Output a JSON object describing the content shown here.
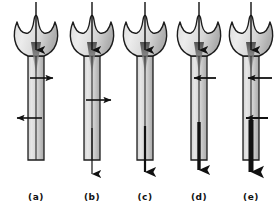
{
  "figure": {
    "title": "",
    "width": 280,
    "height": 213,
    "background_color": "#ffffff",
    "panel_count": 5
  },
  "style": {
    "outline_color": "#1a1a1a",
    "body_fill_light": "#e8e8e8",
    "body_fill_dark": "#b8b8b8",
    "arrow_color": "#111111",
    "label_color": "#111111",
    "stem_center_line_color": "#2b2b2b"
  },
  "panels": [
    {
      "id": "a",
      "label": "(a)",
      "center_x": 36,
      "inflow_arrow": {
        "present": true,
        "direction": "down",
        "from_y": 2,
        "to_y": 58,
        "width": 1.4
      },
      "horizontal_arrows": [
        {
          "y": 78,
          "direction": "right",
          "x_start": 30,
          "x_end": 56,
          "thickness": 1.6
        },
        {
          "y": 118,
          "direction": "left",
          "x_start": 42,
          "x_end": 14,
          "thickness": 1.6
        }
      ],
      "outflow_arrow": {
        "present": false,
        "thickness": 0,
        "from_y": 0,
        "to_y": 0
      }
    },
    {
      "id": "b",
      "label": "(b)",
      "center_x": 92,
      "inflow_arrow": {
        "present": true,
        "direction": "down",
        "from_y": 2,
        "to_y": 58,
        "width": 1.4
      },
      "horizontal_arrows": [
        {
          "y": 100,
          "direction": "right",
          "x_start": 86,
          "x_end": 114,
          "thickness": 1.6
        }
      ],
      "outflow_arrow": {
        "present": true,
        "thickness": 1.2,
        "from_y": 128,
        "to_y": 183
      }
    },
    {
      "id": "c",
      "label": "(c)",
      "center_x": 145,
      "inflow_arrow": {
        "present": true,
        "direction": "down",
        "from_y": 2,
        "to_y": 58,
        "width": 1.4
      },
      "horizontal_arrows": [],
      "outflow_arrow": {
        "present": true,
        "thickness": 2.2,
        "from_y": 126,
        "to_y": 183
      }
    },
    {
      "id": "d",
      "label": "(d)",
      "center_x": 199,
      "inflow_arrow": {
        "present": true,
        "direction": "down",
        "from_y": 2,
        "to_y": 58,
        "width": 1.4
      },
      "horizontal_arrows": [
        {
          "y": 78,
          "direction": "left",
          "x_start": 216,
          "x_end": 190,
          "thickness": 1.8
        }
      ],
      "outflow_arrow": {
        "present": true,
        "thickness": 3.4,
        "from_y": 122,
        "to_y": 183
      }
    },
    {
      "id": "e",
      "label": "(e)",
      "center_x": 251,
      "inflow_arrow": {
        "present": true,
        "direction": "down",
        "from_y": 2,
        "to_y": 58,
        "width": 1.4
      },
      "horizontal_arrows": [
        {
          "y": 78,
          "direction": "left",
          "x_start": 272,
          "x_end": 244,
          "thickness": 1.8
        },
        {
          "y": 118,
          "direction": "left",
          "x_start": 268,
          "x_end": 242,
          "thickness": 2.0
        }
      ],
      "outflow_arrow": {
        "present": true,
        "thickness": 5.0,
        "from_y": 120,
        "to_y": 186
      }
    }
  ],
  "geometry": {
    "bulb_top_y": 18,
    "bulb_bottom_y": 56,
    "bulb_half_width": 19,
    "stem_half_width": 8,
    "stem_bottom_y": 160,
    "label_y": 200
  },
  "labels": {
    "a": "(a)",
    "b": "(b)",
    "c": "(c)",
    "d": "(d)",
    "e": "(e)"
  }
}
